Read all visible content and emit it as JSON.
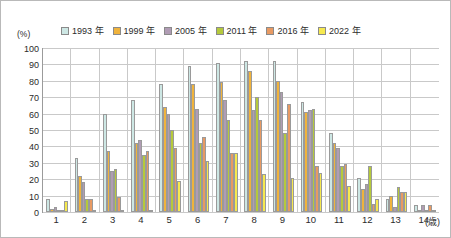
{
  "axes": {
    "y_unit": "(%)",
    "x_unit": "(歳)"
  },
  "chart_data": {
    "type": "bar",
    "title": "",
    "xlabel": "(歳)",
    "ylabel": "(%)",
    "ylim": [
      0,
      100
    ],
    "yticks": [
      0,
      10,
      20,
      30,
      40,
      50,
      60,
      70,
      80,
      90,
      100
    ],
    "grid": true,
    "legend_position": "top",
    "categories": [
      "1",
      "2",
      "3",
      "4",
      "5",
      "6",
      "7",
      "8",
      "9",
      "10",
      "11",
      "12",
      "13",
      "14"
    ],
    "series": [
      {
        "name": "1993 年",
        "color": "#cde7e4",
        "values": [
          8,
          33,
          60,
          68,
          78,
          89,
          91,
          92,
          92,
          67,
          48,
          21,
          8,
          4
        ]
      },
      {
        "name": "1999 年",
        "color": "#f0b33c",
        "values": [
          2,
          22,
          37,
          42,
          64,
          78,
          79,
          86,
          80,
          61,
          42,
          14,
          10,
          0
        ]
      },
      {
        "name": "2005 年",
        "color": "#b09cb4",
        "values": [
          3,
          18,
          25,
          44,
          60,
          63,
          68,
          62,
          73,
          62,
          39,
          17,
          3,
          4
        ]
      },
      {
        "name": "2011 年",
        "color": "#b5c93c",
        "values": [
          0,
          8,
          26,
          35,
          50,
          42,
          56,
          70,
          48,
          63,
          28,
          28,
          15,
          0
        ]
      },
      {
        "name": "2016 年",
        "color": "#e89a63",
        "values": [
          0,
          8,
          9,
          37,
          39,
          46,
          36,
          56,
          66,
          28,
          29,
          5,
          12,
          4
        ]
      },
      {
        "name": "2022 年",
        "color": "#f6e94f",
        "values": [
          7,
          0,
          0,
          0,
          19,
          31,
          36,
          23,
          21,
          24,
          16,
          8,
          12,
          0
        ]
      }
    ]
  }
}
